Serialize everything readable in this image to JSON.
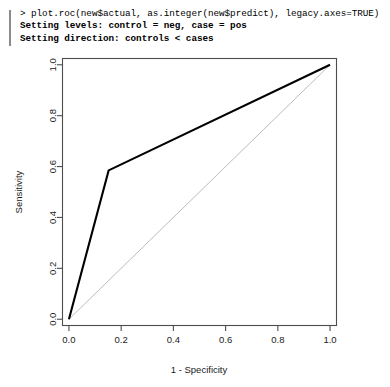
{
  "console": {
    "lines": [
      {
        "text": "> plot.roc(new$actual, as.integer(new$predict), legacy.axes=TRUE)",
        "bold": false
      },
      {
        "text": "Setting levels: control = neg, case = pos",
        "bold": true
      },
      {
        "text": "Setting direction: controls < cases",
        "bold": true
      }
    ]
  },
  "chart_data": {
    "type": "line",
    "title": "",
    "xlabel": "1 - Specificity",
    "ylabel": "Sensitivity",
    "xlim": [
      0.0,
      1.0
    ],
    "ylim": [
      0.0,
      1.0
    ],
    "grid": false,
    "legend": "none",
    "xticks": [
      "0.0",
      "0.2",
      "0.4",
      "0.6",
      "0.8",
      "1.0"
    ],
    "xtick_values": [
      0.0,
      0.2,
      0.4,
      0.6,
      0.8,
      1.0
    ],
    "yticks": [
      "0.0",
      "0.2",
      "0.4",
      "0.6",
      "0.8",
      "1.0"
    ],
    "ytick_values": [
      0.0,
      0.2,
      0.4,
      0.6,
      0.8,
      1.0
    ],
    "series": [
      {
        "name": "ROC curve",
        "color": "#000000",
        "x": [
          0.0,
          0.152,
          1.0
        ],
        "y": [
          0.0,
          0.585,
          1.0
        ]
      },
      {
        "name": "chance diagonal",
        "color": "#bdbdbd",
        "x": [
          0.0,
          1.0
        ],
        "y": [
          0.0,
          1.0
        ]
      }
    ]
  },
  "axis": {
    "x_label": "1 - Specificity",
    "y_label": "Sensitivity"
  }
}
